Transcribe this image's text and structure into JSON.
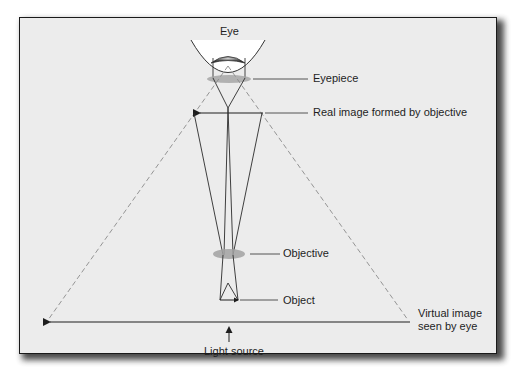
{
  "diagram": {
    "colors": {
      "panel_bg": "#ececec",
      "border": "#1a1a1a",
      "ray": "#2b2b2b",
      "dashed_ray": "#8a8a8a",
      "lens": "#9c9c9c",
      "eye_white": "#ffffff"
    },
    "labels": {
      "eye": "Eye",
      "eyepiece": "Eyepiece",
      "real_image": "Real image formed by objective",
      "objective": "Objective",
      "object": "Object",
      "virtual_image_line1": "Virtual image",
      "virtual_image_line2": "seen by eye",
      "light_source": "Light source"
    }
  }
}
